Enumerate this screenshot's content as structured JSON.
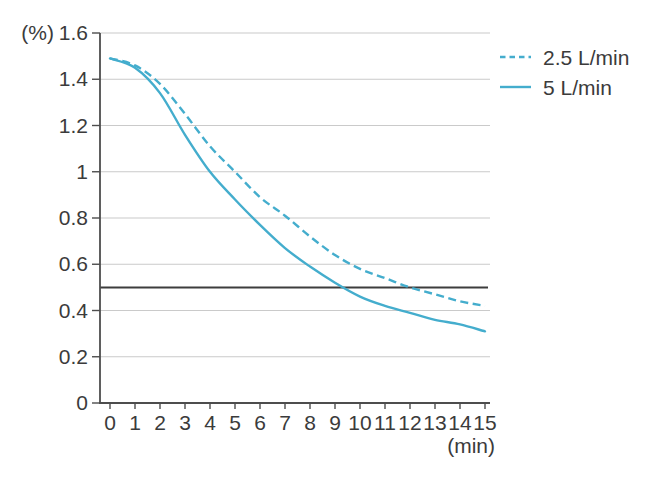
{
  "chart_data": {
    "type": "line",
    "title": "",
    "xlabel": "(min)",
    "ylabel": "(%)",
    "xlim": [
      0,
      15
    ],
    "ylim": [
      0,
      1.6
    ],
    "xticks": [
      0,
      1,
      2,
      3,
      4,
      5,
      6,
      7,
      8,
      9,
      10,
      11,
      12,
      13,
      14,
      15
    ],
    "xtick_labels": [
      "0",
      "1",
      "2",
      "3",
      "4",
      "5",
      "6",
      "7",
      "8",
      "9",
      "10",
      "11",
      "12",
      "13",
      "14",
      "15"
    ],
    "yticks": [
      0,
      0.2,
      0.4,
      0.6,
      0.8,
      1,
      1.2,
      1.4,
      1.6
    ],
    "ytick_labels": [
      "0",
      "0.2",
      "0.4",
      "0.6",
      "0.8",
      "1",
      "1.2",
      "1.4",
      "1.6"
    ],
    "grid": "horizontal-only",
    "legend_position": "top-right-outside",
    "reference_line": {
      "y": 0.5
    },
    "x": [
      0,
      1,
      2,
      3,
      4,
      5,
      6,
      7,
      8,
      9,
      10,
      11,
      12,
      13,
      14,
      15
    ],
    "series": [
      {
        "name": "2.5 L/min",
        "line_style": "dashed",
        "values": [
          1.49,
          1.46,
          1.38,
          1.25,
          1.11,
          1.0,
          0.89,
          0.81,
          0.72,
          0.64,
          0.58,
          0.54,
          0.5,
          0.47,
          0.44,
          0.42
        ]
      },
      {
        "name": "5 L/min",
        "line_style": "solid",
        "values": [
          1.49,
          1.45,
          1.34,
          1.16,
          1.0,
          0.88,
          0.77,
          0.67,
          0.59,
          0.52,
          0.46,
          0.42,
          0.39,
          0.36,
          0.34,
          0.31
        ]
      }
    ],
    "colors": {
      "series_blue": "#44adcd",
      "reference_line": "#3d3d3d",
      "grid": "#cacaca",
      "axis": "#4d4d4d",
      "text": "#3b3b3b",
      "background": "#ffffff"
    }
  }
}
